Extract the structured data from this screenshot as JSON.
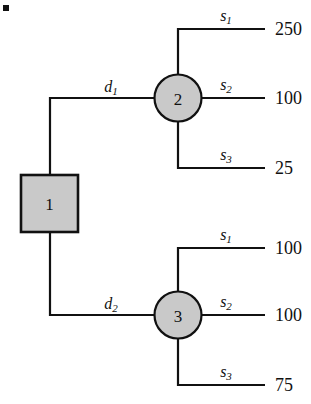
{
  "diagram": {
    "type": "decision-tree",
    "colors": {
      "node_fill": "#c9c9c9",
      "stroke": "#111111",
      "background": "#ffffff"
    },
    "decision_node": {
      "id": "1",
      "label": "1",
      "shape": "square"
    },
    "chance_nodes": [
      {
        "id": "2",
        "label": "2",
        "shape": "circle"
      },
      {
        "id": "3",
        "label": "3",
        "shape": "circle"
      }
    ],
    "decision_branches": [
      {
        "id": "d1",
        "letter": "d",
        "subscript": "1",
        "to": "2"
      },
      {
        "id": "d2",
        "letter": "d",
        "subscript": "2",
        "to": "3"
      }
    ],
    "outcome_branches": [
      {
        "node": "2",
        "letter": "s",
        "subscript": "1",
        "payoff": "250"
      },
      {
        "node": "2",
        "letter": "s",
        "subscript": "2",
        "payoff": "100"
      },
      {
        "node": "2",
        "letter": "s",
        "subscript": "3",
        "payoff": "25"
      },
      {
        "node": "3",
        "letter": "s",
        "subscript": "1",
        "payoff": "100"
      },
      {
        "node": "3",
        "letter": "s",
        "subscript": "2",
        "payoff": "100"
      },
      {
        "node": "3",
        "letter": "s",
        "subscript": "3",
        "payoff": "75"
      }
    ]
  }
}
